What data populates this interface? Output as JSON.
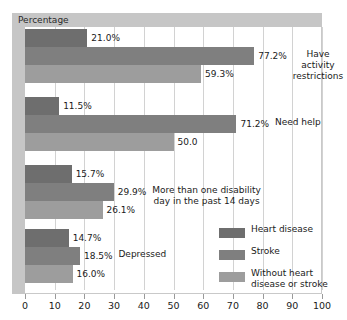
{
  "chart_data": {
    "type": "bar",
    "orientation": "horizontal",
    "title": "Percentage",
    "xlabel": "",
    "ylabel": "",
    "xlim": [
      0,
      100
    ],
    "xticks": [
      0,
      10,
      20,
      30,
      40,
      50,
      60,
      70,
      80,
      90,
      100
    ],
    "grid": true,
    "legend_position": "lower-right",
    "categories": [
      "Have activity restrictions",
      "Need help",
      "More than one disability day in the past 14 days",
      "Depressed"
    ],
    "category_labels": [
      "Have activity\nrestrictions",
      "Need help",
      "More than one disability\nday in the past 14 days",
      "Depressed"
    ],
    "series": [
      {
        "name": "Heart disease",
        "color": "#6e6e6e",
        "values": [
          21.0,
          11.5,
          15.7,
          14.7
        ],
        "labels": [
          "21.0%",
          "11.5%",
          "15.7%",
          "14.7%"
        ]
      },
      {
        "name": "Stroke",
        "color": "#7f7f7f",
        "values": [
          77.2,
          71.2,
          29.9,
          18.5
        ],
        "labels": [
          "77.2%",
          "71.2%",
          "29.9%",
          "18.5%"
        ]
      },
      {
        "name": "Without heart disease or stroke",
        "color": "#9d9d9d",
        "values": [
          59.3,
          50.0,
          26.1,
          16.0
        ],
        "labels": [
          "59.3%",
          "50.0",
          "26.1%",
          "16.0%"
        ]
      }
    ]
  },
  "legend": {
    "items": [
      {
        "label": "Heart disease",
        "color": "#6e6e6e"
      },
      {
        "label": "Stroke",
        "color": "#7f7f7f"
      },
      {
        "label": "Without heart\ndisease or stroke",
        "color": "#9d9d9d"
      }
    ]
  },
  "axis": {
    "x_tick_labels": [
      "0",
      "10",
      "20",
      "30",
      "40",
      "50",
      "60",
      "70",
      "80",
      "90",
      "100"
    ]
  },
  "colors": {
    "series_1": "#6e6e6e",
    "series_2": "#7f7f7f",
    "series_3": "#9d9d9d",
    "band": "#c6c6c6",
    "grid": "#d2d2d2",
    "frame": "#c9c9c9"
  }
}
